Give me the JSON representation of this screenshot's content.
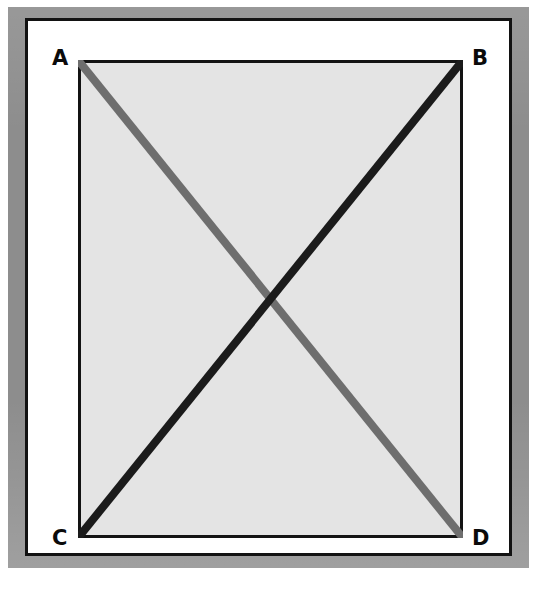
{
  "figure": {
    "canvas": {
      "width": 537,
      "height": 612
    },
    "frame": {
      "band_color": "#8d8d8d",
      "rule_color": "#121212",
      "mat_color": "#ffffff"
    },
    "rectangle": {
      "fill_color": "#e4e4e4",
      "stroke_color": "#131313",
      "stroke_width": 3,
      "x": 78,
      "y": 60,
      "width": 385,
      "height": 478
    },
    "vertices": [
      {
        "id": "A",
        "label": "A",
        "position": "top-left",
        "x": 0,
        "y": 0
      },
      {
        "id": "B",
        "label": "B",
        "position": "top-right",
        "x": 385,
        "y": 0
      },
      {
        "id": "C",
        "label": "C",
        "position": "bottom-left",
        "x": 0,
        "y": 478
      },
      {
        "id": "D",
        "label": "D",
        "position": "bottom-right",
        "x": 385,
        "y": 478
      }
    ],
    "diagonals": [
      {
        "id": "AD",
        "from": "A",
        "to": "D",
        "color": "#6e6e6e",
        "width": 8,
        "z_order": 1,
        "description": "gray diagonal from top-left A to bottom-right D"
      },
      {
        "id": "CB",
        "from": "C",
        "to": "B",
        "color": "#1b1b1b",
        "width": 8,
        "z_order": 2,
        "description": "black diagonal from bottom-left C to top-right B, drawn over the gray diagonal"
      }
    ],
    "intersection": {
      "label": "",
      "x": 192.5,
      "y": 239
    }
  }
}
